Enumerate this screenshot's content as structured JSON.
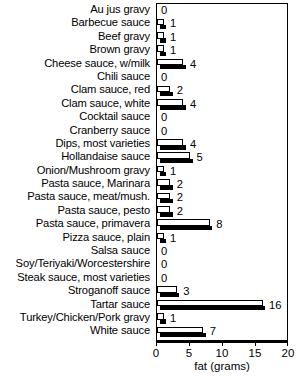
{
  "chart_data": {
    "type": "bar",
    "orientation": "horizontal",
    "title": "",
    "xlabel": "fat (grams)",
    "ylabel": "",
    "xlim": [
      0,
      20
    ],
    "xticks": [
      0,
      5,
      10,
      15,
      20
    ],
    "grid": false,
    "legend": null,
    "value_labels": true,
    "categories": [
      "Au jus gravy",
      "Barbecue sauce",
      "Beef gravy",
      "Brown gravy",
      "Cheese sauce, w/milk",
      "Chili sauce",
      "Clam sauce, red",
      "Clam sauce, white",
      "Cocktail sauce",
      "Cranberry sauce",
      "Dips, most varieties",
      "Hollandaise sauce",
      "Onion/Mushroom gravy",
      "Pasta sauce, Marinara",
      "Pasta sauce, meat/mush.",
      "Pasta sauce, pesto",
      "Pasta sauce, primavera",
      "Pizza sauce, plain",
      "Salsa sauce",
      "Soy/Teriyaki/Worcestershire",
      "Steak sauce, most varieties",
      "Stroganoff sauce",
      "Tartar sauce",
      "Turkey/Chicken/Pork gravy",
      "White sauce"
    ],
    "values": [
      0,
      1,
      1,
      1,
      4,
      0,
      2,
      4,
      0,
      0,
      4,
      5,
      1,
      2,
      2,
      2,
      8,
      1,
      0,
      0,
      0,
      3,
      16,
      1,
      7
    ]
  },
  "colors": {
    "bar_face": "#ffffff",
    "bar_outline": "#000000",
    "bar_shadow": "#000000",
    "axis": "#000000",
    "background": "#ffffff"
  }
}
